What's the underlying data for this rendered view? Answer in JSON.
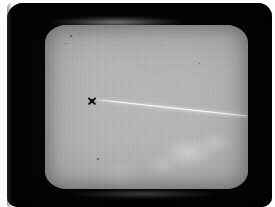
{
  "image": {
    "kind": "photograph-of-crt-display",
    "subject": "Bright diagonal streak and dark cross marker on a grey CRT phosphor screen",
    "width_px": 275,
    "height_px": 207,
    "caption": ""
  },
  "colors": {
    "photo_margin": "#fcfcfc",
    "bezel": "#050505",
    "screen_center": "#b7b7b7",
    "screen_edge": "#848484",
    "trail": "#ffffff",
    "marker": "#1a1a1a"
  },
  "bezel": {
    "name": "crt-monitor-bezel",
    "left_px": 7,
    "top_px": 3,
    "width_px": 265,
    "height_px": 204,
    "corner_radius_px": 16
  },
  "screen": {
    "name": "crt-phosphor-screen",
    "left_px": 38,
    "top_px": 22,
    "width_px": 203,
    "height_px": 164,
    "corner_radius_px": 22,
    "texture": "raster-scanlines",
    "background_level": "mid-grey"
  },
  "glare": {
    "top_band_label": "glass-reflection-top",
    "bottom_band_label": "glass-reflection-bottom"
  },
  "features": [
    {
      "name": "streak-trail",
      "type": "line",
      "description": "Bright thin white diagonal streak",
      "start_px": [
        88,
        96
      ],
      "end_px": [
        238,
        112
      ],
      "angle_deg": 6.2,
      "brightness": "high"
    },
    {
      "name": "cross-marker",
      "type": "x-marker",
      "description": "Dark X shaped marker with solid centre",
      "center_px": [
        79,
        98
      ],
      "size_px": 11,
      "brightness": "dark"
    }
  ],
  "blotches": [
    {
      "name": "phosphor-blotch",
      "center_px": [
        181,
        150
      ],
      "radius_px": 19
    },
    {
      "name": "phosphor-blotch",
      "center_px": [
        208,
        140
      ],
      "radius_px": 13
    },
    {
      "name": "phosphor-blotch",
      "center_px": [
        156,
        162
      ],
      "radius_px": 11
    },
    {
      "name": "phosphor-blotch",
      "center_px": [
        113,
        172
      ],
      "radius_px": 15
    }
  ],
  "specks": [
    {
      "name": "dust-speck",
      "left_px": 63,
      "top_px": 32,
      "size_px": 2
    },
    {
      "name": "dust-speck",
      "left_px": 71,
      "top_px": 30,
      "size_px": 1
    },
    {
      "name": "dust-speck",
      "left_px": 58,
      "top_px": 40,
      "size_px": 1
    },
    {
      "name": "dust-speck",
      "left_px": 90,
      "top_px": 155,
      "size_px": 2
    },
    {
      "name": "dust-speck",
      "left_px": 192,
      "top_px": 60,
      "size_px": 1
    }
  ]
}
